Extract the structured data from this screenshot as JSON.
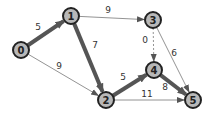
{
  "graph": {
    "nodes": [
      {
        "id": "0",
        "x": 21,
        "y": 50
      },
      {
        "id": "1",
        "x": 71,
        "y": 16
      },
      {
        "id": "2",
        "x": 106,
        "y": 100
      },
      {
        "id": "3",
        "x": 153,
        "y": 20
      },
      {
        "id": "4",
        "x": 154,
        "y": 70
      },
      {
        "id": "5",
        "x": 193,
        "y": 100
      }
    ],
    "edges": [
      {
        "from": "0",
        "to": "1",
        "weight": "5",
        "bold": true,
        "lx": 38,
        "ly": 30
      },
      {
        "from": "0",
        "to": "2",
        "weight": "9",
        "bold": false,
        "lx": 59,
        "ly": 69
      },
      {
        "from": "1",
        "to": "3",
        "weight": "9",
        "bold": false,
        "lx": 108,
        "ly": 13
      },
      {
        "from": "1",
        "to": "2",
        "weight": "7",
        "bold": true,
        "lx": 95,
        "ly": 48
      },
      {
        "from": "3",
        "to": "4",
        "weight": "0",
        "bold": false,
        "dashed": true,
        "lx": 145,
        "ly": 43
      },
      {
        "from": "3",
        "to": "5",
        "weight": "6",
        "bold": false,
        "lx": 174,
        "ly": 56
      },
      {
        "from": "2",
        "to": "4",
        "weight": "5",
        "bold": true,
        "lx": 123,
        "ly": 80
      },
      {
        "from": "2",
        "to": "5",
        "weight": "11",
        "bold": false,
        "lx": 147,
        "ly": 97
      },
      {
        "from": "4",
        "to": "5",
        "weight": "8",
        "bold": true,
        "lx": 165,
        "ly": 90
      }
    ]
  },
  "colors": {
    "node_fill": "#b8b8b8",
    "node_stroke": "#222222",
    "bold_edge": "#555555",
    "thin_edge": "#777777",
    "label": "#333333"
  }
}
